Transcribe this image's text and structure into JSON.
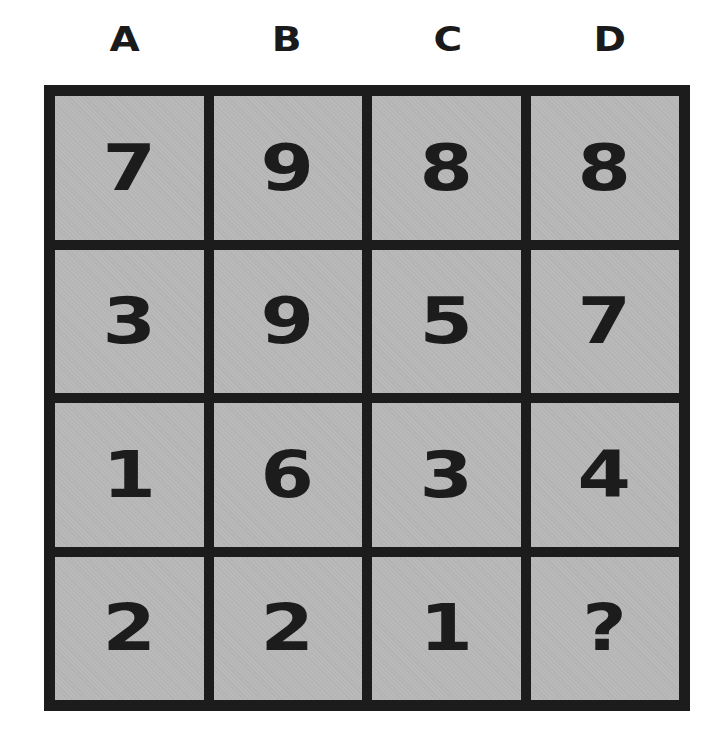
{
  "columns": [
    "A",
    "B",
    "C",
    "D"
  ],
  "rows": [
    [
      "7",
      "9",
      "8",
      "8"
    ],
    [
      "3",
      "9",
      "5",
      "7"
    ],
    [
      "1",
      "6",
      "3",
      "4"
    ],
    [
      "2",
      "2",
      "1",
      "?"
    ]
  ],
  "colors": {
    "grid_line": "#1c1c1c",
    "cell_bg": "#b9b9b9",
    "text": "#1c1c1c"
  }
}
